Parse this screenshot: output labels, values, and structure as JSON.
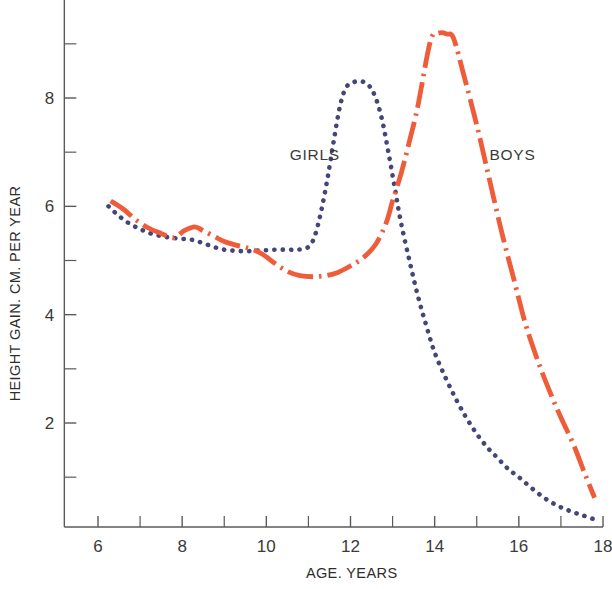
{
  "chart_data": {
    "type": "line",
    "title": "",
    "xlabel": "AGE. YEARS",
    "ylabel": "HEIGHT GAIN. CM. PER YEAR",
    "xlim": [
      5.2,
      18.0
    ],
    "ylim": [
      0.0,
      9.9
    ],
    "grid": false,
    "legend_position": "inline-annotations",
    "x_ticks_major": [
      6,
      8,
      10,
      12,
      14,
      16,
      18
    ],
    "x_ticks_major_labels": [
      "6",
      "8",
      "10",
      "12",
      "14",
      "16",
      "18"
    ],
    "x_ticks_minor": [
      7,
      9,
      11,
      13,
      15,
      17
    ],
    "y_ticks_major": [
      2,
      4,
      6,
      8
    ],
    "y_ticks_major_labels": [
      "2",
      "4",
      "6",
      "8"
    ],
    "y_ticks_minor": [
      1,
      3,
      5,
      7,
      9
    ],
    "series": [
      {
        "name": "GIRLS",
        "label": "GIRLS",
        "color": "#44467a",
        "style": "dotted",
        "label_x": 11.15,
        "label_y": 6.85,
        "x": [
          6.25,
          6.5,
          6.75,
          7.0,
          7.25,
          7.5,
          7.75,
          8.0,
          8.25,
          8.5,
          8.75,
          9.0,
          9.25,
          9.5,
          9.75,
          10.0,
          10.25,
          10.5,
          10.75,
          11.0,
          11.15,
          11.3,
          11.45,
          11.6,
          11.75,
          11.9,
          12.1,
          12.3,
          12.45,
          12.6,
          12.75,
          12.9,
          13.05,
          13.2,
          13.4,
          13.6,
          13.8,
          14.0,
          14.25,
          14.5,
          14.75,
          15.0,
          15.25,
          15.5,
          15.75,
          16.0,
          16.3,
          16.6,
          16.9,
          17.2,
          17.5,
          17.8
        ],
        "y": [
          6.0,
          5.82,
          5.68,
          5.58,
          5.5,
          5.45,
          5.42,
          5.4,
          5.38,
          5.32,
          5.25,
          5.2,
          5.18,
          5.17,
          5.18,
          5.19,
          5.2,
          5.2,
          5.2,
          5.25,
          5.45,
          5.9,
          6.5,
          7.2,
          7.85,
          8.2,
          8.3,
          8.3,
          8.22,
          8.0,
          7.6,
          7.0,
          6.35,
          5.7,
          5.0,
          4.35,
          3.8,
          3.3,
          2.85,
          2.45,
          2.1,
          1.8,
          1.55,
          1.35,
          1.15,
          1.0,
          0.8,
          0.62,
          0.48,
          0.38,
          0.3,
          0.22
        ]
      },
      {
        "name": "BOYS",
        "label": "BOYS",
        "color": "#ef5c3a",
        "style": "dash-dot",
        "label_x": 15.85,
        "label_y": 6.85,
        "x": [
          6.3,
          6.6,
          6.9,
          7.2,
          7.5,
          7.8,
          8.05,
          8.3,
          8.5,
          8.75,
          9.0,
          9.3,
          9.6,
          9.9,
          10.2,
          10.5,
          10.8,
          11.1,
          11.4,
          11.7,
          12.0,
          12.3,
          12.6,
          12.85,
          13.0,
          13.2,
          13.4,
          13.6,
          13.9,
          14.1,
          14.3,
          14.45,
          14.7,
          15.0,
          15.3,
          15.6,
          15.9,
          16.15,
          16.45,
          16.75,
          17.0,
          17.3,
          17.55,
          17.8
        ],
        "y": [
          6.1,
          5.95,
          5.75,
          5.6,
          5.5,
          5.42,
          5.55,
          5.62,
          5.55,
          5.45,
          5.35,
          5.28,
          5.22,
          5.12,
          4.95,
          4.8,
          4.72,
          4.7,
          4.72,
          4.78,
          4.9,
          5.05,
          5.3,
          5.7,
          6.1,
          6.6,
          7.2,
          7.85,
          9.05,
          9.2,
          9.18,
          9.1,
          8.4,
          7.5,
          6.5,
          5.5,
          4.6,
          3.85,
          3.15,
          2.55,
          2.1,
          1.6,
          1.1,
          0.62
        ]
      }
    ]
  }
}
